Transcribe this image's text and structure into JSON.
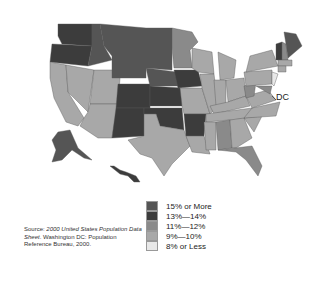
{
  "map": {
    "title": "",
    "annotation_dc": "DC",
    "legend": [
      {
        "label": "15% or More",
        "color": "#555555"
      },
      {
        "label": "13%—14%",
        "color": "#3c3c3c"
      },
      {
        "label": "11%—12%",
        "color": "#8a8a8a"
      },
      {
        "label": "9%—10%",
        "color": "#a8a8a8"
      },
      {
        "label": "8% or Less",
        "color": "#e8e8e8"
      }
    ],
    "source": {
      "prefix": "Source: ",
      "title": "2000 United States Population Data Sheet",
      "suffix": ". Washington DC: Population Reference Bureau, 2000."
    }
  }
}
